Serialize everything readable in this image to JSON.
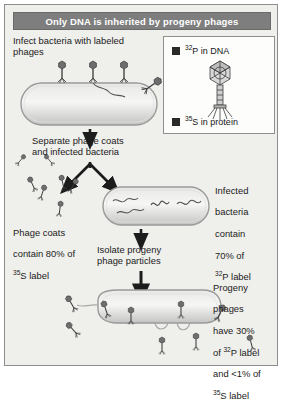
{
  "figure": {
    "title": "Only DNA is inherited by progeny phages",
    "background_color": "#efefec",
    "title_bar_color": "#7e7e7e",
    "title_text_color": "#ffffff",
    "border_color": "#8d8d8d"
  },
  "legend": {
    "swatch_color": "#2a2a2a",
    "items": [
      {
        "isotope": "32",
        "element": "P",
        "text": " in DNA"
      },
      {
        "isotope": "35",
        "element": "S",
        "text": " in protein"
      }
    ],
    "icon": "bacteriophage-icon"
  },
  "steps": {
    "step1": "Infect bacteria with labeled\nphages",
    "step2": "Separate phage coats\nand infected bacteria",
    "step3": "Isolate progeny\nphage particles"
  },
  "captions": {
    "phage_coats": {
      "line1": "Phage coats",
      "line2": "contain 80% of",
      "isotope": "35",
      "element": "S",
      "line3": " label"
    },
    "infected_bacteria": {
      "line1": "Infected",
      "line2": "bacteria",
      "line3": "contain",
      "line4": "70% of",
      "isotope": "32",
      "element": "P",
      "line5": " label"
    },
    "progeny_phages": {
      "line1": "Progeny",
      "line2": "phages",
      "line3": "have 30%",
      "line4_pre": "of ",
      "isotope_a": "32",
      "element_a": "P",
      "line4_post": " label",
      "line5": "and <1% of",
      "isotope_b": "35",
      "element_b": "S",
      "line6": " label"
    }
  },
  "colors": {
    "cell_stroke": "#9a9a9a",
    "cell_fill_light": "#f2f2f0",
    "cell_fill_dark": "#c9c9c7",
    "phage": "#4a4a4a",
    "arrow": "#1c1c1c",
    "dna": "#555555"
  }
}
